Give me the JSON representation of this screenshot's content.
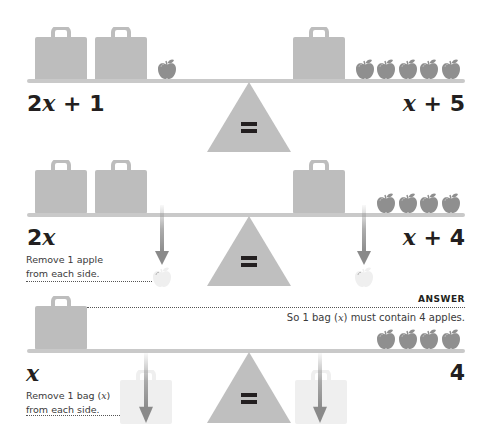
{
  "colors": {
    "object_gray": "#bdbdbd",
    "beam_gray": "#c9c9c9",
    "fulcrum_gray": "#bfbfbf",
    "apple_gray": "#8f8f8f",
    "faded": "#efefef",
    "arrow": "#8a8a8a",
    "text": "#231f20"
  },
  "panels": [
    {
      "id": "step-1",
      "left": {
        "bags": 2,
        "apples": 1,
        "expression": {
          "coef": "2",
          "var": "x",
          "rest": " + 1"
        }
      },
      "right": {
        "bags": 1,
        "apples": 5,
        "expression": {
          "coef": "",
          "var": "x",
          "rest": " + 5"
        }
      },
      "fulcrum_symbol": "="
    },
    {
      "id": "step-2",
      "left": {
        "bags": 2,
        "apples": 0,
        "expression": {
          "coef": "2",
          "var": "x",
          "rest": ""
        }
      },
      "right": {
        "bags": 1,
        "apples": 4,
        "expression": {
          "coef": "",
          "var": "x",
          "rest": " + 4"
        }
      },
      "fulcrum_symbol": "=",
      "instruction": {
        "line1": "Remove 1 apple",
        "line2": "from each side."
      },
      "removed": "apple"
    },
    {
      "id": "step-3",
      "left": {
        "bags": 1,
        "apples": 0,
        "expression": {
          "coef": "",
          "var": "x",
          "rest": ""
        }
      },
      "right": {
        "bags": 0,
        "apples": 4,
        "expression": {
          "coef": "",
          "var": "",
          "rest": "4"
        }
      },
      "fulcrum_symbol": "=",
      "instruction": {
        "line1_pre": "Remove 1 bag (",
        "line1_var": "x",
        "line1_post": ")",
        "line2": "from each side."
      },
      "removed": "bag",
      "answer": {
        "label": "ANSWER",
        "text_pre": "So 1 bag (",
        "text_var": "x",
        "text_post": ") must contain 4 apples."
      }
    }
  ]
}
